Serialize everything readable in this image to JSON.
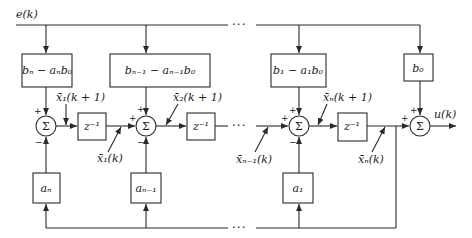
{
  "diagram": {
    "input_label": "e(k)",
    "output_label": "u(k)",
    "ellipsis": "···",
    "gain_blocks_top": [
      {
        "label": "bₙ − aₙb₀"
      },
      {
        "label": "bₙ₋₁ − aₙ₋₁b₀"
      },
      {
        "label": "b₁ − a₁b₀"
      },
      {
        "label": "b₀"
      }
    ],
    "delay_blocks": [
      {
        "label": "z⁻¹"
      },
      {
        "label": "z⁻¹"
      },
      {
        "label": "z⁻¹"
      }
    ],
    "feedback_blocks": [
      {
        "label": "aₙ"
      },
      {
        "label": "aₙ₋₁"
      },
      {
        "label": "a₁"
      }
    ],
    "summing_junction_symbol": "Σ",
    "signs": {
      "plus": "+",
      "minus": "−"
    },
    "signal_labels": [
      {
        "label": "x̄₁(k + 1)"
      },
      {
        "label": "x̄₁(k)"
      },
      {
        "label": "x̄₂(k + 1)"
      },
      {
        "label": "x̄ₙ₋₁(k)"
      },
      {
        "label": "x̄ₙ(k + 1)"
      },
      {
        "label": "x̄ₙ(k)"
      }
    ]
  }
}
